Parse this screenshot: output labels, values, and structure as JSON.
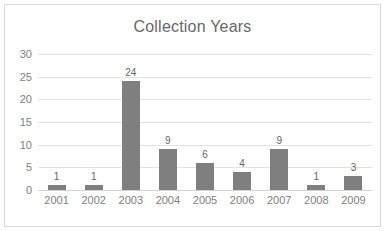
{
  "chart_data": {
    "type": "bar",
    "title": "Collection Years",
    "xlabel": "",
    "ylabel": "",
    "categories": [
      "2001",
      "2002",
      "2003",
      "2004",
      "2005",
      "2006",
      "2007",
      "2008",
      "2009"
    ],
    "values": [
      1,
      1,
      24,
      9,
      6,
      4,
      9,
      1,
      3
    ],
    "data_labels": [
      "1",
      "1",
      "24",
      "9",
      "6",
      "4",
      "9",
      "1",
      "3"
    ],
    "ylim": [
      0,
      30
    ],
    "yticks": [
      0,
      5,
      10,
      15,
      20,
      25,
      30
    ],
    "ytick_labels": [
      "0",
      "5",
      "10",
      "15",
      "20",
      "25",
      "30"
    ],
    "grid": true,
    "grid_axis": "y",
    "legend": false,
    "legend_position": "none",
    "series": [
      {
        "name": "Collection Years",
        "values": [
          1,
          1,
          24,
          9,
          6,
          4,
          9,
          1,
          3
        ]
      }
    ]
  },
  "colors": {
    "bar": "#7f7f7f",
    "gridline": "#e2e2e2",
    "baseline": "#d2d2d2",
    "title_text": "#676767",
    "tick_text": "#808080",
    "label_text": "#666666",
    "border": "#d9d9d9",
    "background": "#ffffff"
  }
}
